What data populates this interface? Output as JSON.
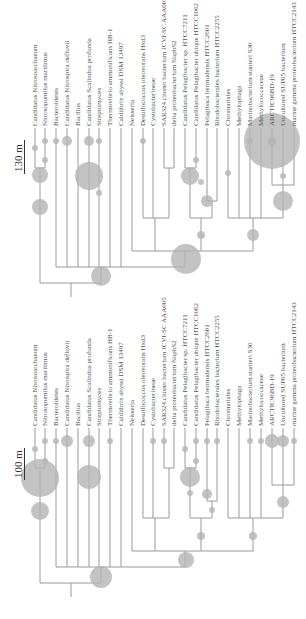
{
  "figure": {
    "type": "phylogenetic-tree-pair",
    "colors": {
      "branch": "#9a9a9a",
      "bubble": "#b4b4b4",
      "text": "#555555"
    }
  },
  "leaves": [
    "Candidatus Nitrosoarchaeum",
    "Nitrosopumilus maritimus",
    "Bacteroidetes",
    "Candidatus Nitrospira defluvii",
    "Bacillus",
    "Candidatus Scalindua profunda",
    "Streptomyces",
    "Thermovibrio ammonificans HB-1",
    "Caldithrix abyssi DSM 13497",
    "Neisseria",
    "Desulfococcus oleovorans Hxd3",
    "Cystobacterineae",
    "SAR324 cluster bacterium JCVI-SC AAA005",
    "delta proteobacterium NaphS2",
    "Candidatus Pelagibacter sp. HTCC7211",
    "Candidatus Pelagibacter ubique HTCC1062",
    "Pelagibaca bermudensis HTCC2601",
    "Rhodobacterales bacterium HTCC2255",
    "Chromatiales",
    "Methylophaga",
    "Marinobacterium stanieri S30",
    "Methylococcaceae",
    "ARCTIC96BD-19",
    "Uncultured SUP05 bacterium",
    "marine gamma proteobacterium HTCC2143"
  ],
  "panels": [
    {
      "scale_label": "130 m",
      "bubbles": [
        [
          35,
          148,
          3
        ],
        [
          45,
          141,
          3
        ],
        [
          45,
          160,
          3
        ],
        [
          56,
          141,
          3
        ],
        [
          67,
          141,
          5
        ],
        [
          89,
          141,
          5
        ],
        [
          99,
          141,
          3
        ],
        [
          143,
          141,
          3
        ],
        [
          40,
          175,
          8
        ],
        [
          40,
          207,
          8
        ],
        [
          89,
          176,
          14
        ],
        [
          99,
          193,
          3
        ],
        [
          201,
          182,
          3
        ],
        [
          190,
          176,
          9
        ],
        [
          207,
          201,
          6
        ],
        [
          196,
          160,
          3
        ],
        [
          228,
          173,
          3
        ],
        [
          250,
          141,
          3
        ],
        [
          272,
          141,
          28
        ],
        [
          272,
          141,
          4
        ],
        [
          283,
          176,
          3
        ],
        [
          283,
          201,
          10
        ],
        [
          101,
          276,
          10
        ],
        [
          186,
          259,
          15
        ],
        [
          201,
          235,
          4
        ],
        [
          253,
          235,
          6
        ]
      ]
    },
    {
      "scale_label": "100 m",
      "bubbles": [
        [
          35,
          449,
          3
        ],
        [
          45,
          441,
          3
        ],
        [
          45,
          461,
          3
        ],
        [
          56,
          441,
          3
        ],
        [
          67,
          441,
          6
        ],
        [
          89,
          441,
          6
        ],
        [
          110,
          441,
          3
        ],
        [
          153,
          441,
          3
        ],
        [
          164,
          441,
          3
        ],
        [
          40,
          478,
          19
        ],
        [
          40,
          511,
          9
        ],
        [
          89,
          477,
          12
        ],
        [
          185,
          449,
          3
        ],
        [
          196,
          461,
          3
        ],
        [
          190,
          477,
          10
        ],
        [
          190,
          493,
          3
        ],
        [
          207,
          494,
          5
        ],
        [
          212,
          510,
          3
        ],
        [
          196,
          441,
          3
        ],
        [
          207,
          441,
          3
        ],
        [
          217,
          441,
          3
        ],
        [
          250,
          441,
          3
        ],
        [
          261,
          441,
          3
        ],
        [
          272,
          441,
          7
        ],
        [
          283,
          441,
          6
        ],
        [
          294,
          441,
          3
        ],
        [
          283,
          502,
          6
        ],
        [
          101,
          577,
          11
        ],
        [
          186,
          560,
          8
        ],
        [
          201,
          536,
          4
        ],
        [
          253,
          536,
          4
        ]
      ]
    }
  ]
}
